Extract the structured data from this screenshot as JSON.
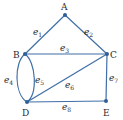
{
  "graph": {
    "edge_color": "#3f6fa6",
    "node_color": "#2e5f98",
    "vertices": [
      {
        "id": "A",
        "label": "A",
        "x": 65,
        "y": 15,
        "lx": 64,
        "ly": 9
      },
      {
        "id": "B",
        "label": "B",
        "x": 25,
        "y": 54,
        "lx": 17,
        "ly": 57
      },
      {
        "id": "C",
        "label": "C",
        "x": 107,
        "y": 54,
        "lx": 113,
        "ly": 57
      },
      {
        "id": "D",
        "label": "D",
        "x": 27,
        "y": 102,
        "lx": 25,
        "ly": 115
      },
      {
        "id": "E",
        "label": "E",
        "x": 106,
        "y": 101,
        "lx": 106,
        "ly": 115
      }
    ],
    "edges": [
      {
        "id": "e1",
        "base": "e",
        "sub": "1",
        "from": "A",
        "to": "B",
        "lx": 35,
        "ly": 33
      },
      {
        "id": "e2",
        "base": "e",
        "sub": "2",
        "from": "A",
        "to": "C",
        "lx": 85,
        "ly": 33
      },
      {
        "id": "e3",
        "base": "e",
        "sub": "3",
        "from": "B",
        "to": "C",
        "lx": 61,
        "ly": 50
      },
      {
        "id": "e4",
        "base": "e",
        "sub": "4",
        "from": "B",
        "to": "D",
        "curve": "left",
        "lx": 7,
        "ly": 82
      },
      {
        "id": "e5",
        "base": "e",
        "sub": "5",
        "from": "B",
        "to": "D",
        "curve": "right",
        "lx": 36,
        "ly": 82
      },
      {
        "id": "e6",
        "base": "e",
        "sub": "6",
        "from": "D",
        "to": "C",
        "lx": 66,
        "ly": 87
      },
      {
        "id": "e7",
        "base": "e",
        "sub": "7",
        "from": "C",
        "to": "E",
        "lx": 110,
        "ly": 80
      },
      {
        "id": "e8",
        "base": "e",
        "sub": "8",
        "from": "D",
        "to": "E",
        "lx": 63,
        "ly": 109
      }
    ]
  }
}
